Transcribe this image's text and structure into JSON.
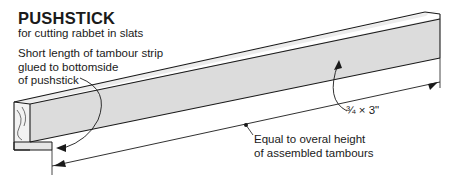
{
  "title": "PUSHSTICK",
  "subtitle": "for cutting rabbet in slats",
  "callouts": {
    "strip": [
      "Short length of tambour strip",
      "glued to bottomside",
      "of pushstick"
    ],
    "length": [
      "Equal to overal height",
      "of assembled tambours"
    ],
    "size": "¾ × 3\""
  },
  "colors": {
    "line": "#1a1a1a",
    "face": "#dcdcdc",
    "top": "#ececec",
    "end": "#f2f2f2"
  }
}
